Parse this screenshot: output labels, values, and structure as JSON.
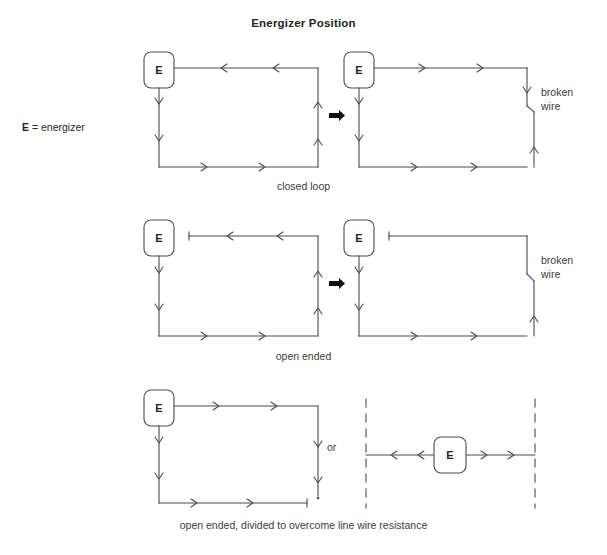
{
  "title": "Energizer Position",
  "legend": {
    "symbol": "E",
    "equals": "=",
    "text": "energizer"
  },
  "labels": {
    "broken_wire": "broken\nwire",
    "broken_wire_line1": "broken",
    "broken_wire_line2": "wire",
    "or": "or",
    "energizer_symbol": "E"
  },
  "rows": [
    {
      "id": "row-closed-loop",
      "caption": "closed loop",
      "left": {
        "name": "closed-loop-intact",
        "energizer": "E",
        "topology": "closed rectangle loop",
        "flow_direction": "counterclockwise",
        "arrow_count": 8,
        "broken": false
      },
      "right": {
        "name": "closed-loop-broken",
        "energizer": "E",
        "topology": "rectangle with break in right side",
        "flow_direction": "clockwise",
        "arrow_count": 8,
        "broken": true,
        "break_label": "broken wire"
      },
      "transition_arrow": "block-arrow-right"
    },
    {
      "id": "row-open-ended",
      "caption": "open ended",
      "left": {
        "name": "open-ended-intact",
        "energizer": "E",
        "topology": "open rectangle, terminal insulator on top-left",
        "flow_direction": "counterclockwise",
        "arrow_count": 8,
        "broken": false,
        "terminal": true
      },
      "right": {
        "name": "open-ended-broken",
        "energizer": "E",
        "topology": "open rectangle with break in right side, top wire dead",
        "flow_direction": "clockwise (lower portion only)",
        "arrow_count": 4,
        "broken": true,
        "terminal": true,
        "break_label": "broken wire"
      },
      "transition_arrow": "block-arrow-right"
    },
    {
      "id": "row-divided",
      "caption": "open ended, divided to overcome line wire resistance",
      "left": {
        "name": "divided-c-shape",
        "energizer": "E",
        "topology": "C shape, terminal insulator at bottom-right end",
        "flow_direction": "clockwise",
        "arrow_count": 8,
        "broken": false,
        "terminal": true
      },
      "right": {
        "name": "divided-center-fed",
        "energizer": "E",
        "topology": "center-fed horizontal line between dashed boundaries",
        "flow_direction": "bidirectional outward",
        "arrow_count": 4,
        "broken": false,
        "boundary": "dashed"
      },
      "connector_label": "or"
    }
  ],
  "colors": {
    "ink": "#231f20",
    "wire": "#4a4a4a",
    "caption": "#3a3a3a",
    "background": "#ffffff"
  }
}
